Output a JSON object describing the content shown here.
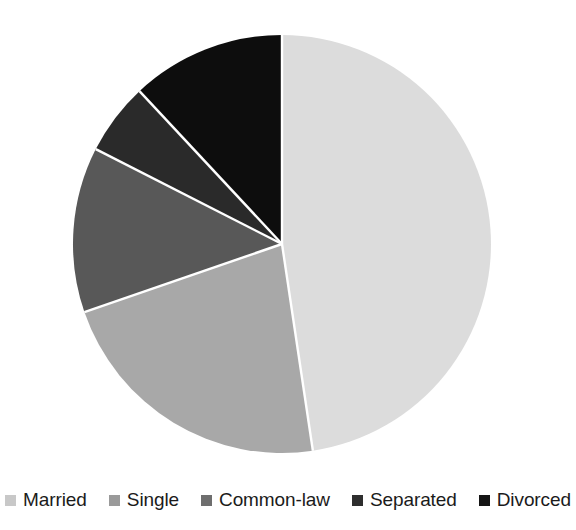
{
  "chart_data": {
    "type": "pie",
    "title": "",
    "subtitle": "",
    "xlabel": "",
    "ylabel": "",
    "legend_position": "bottom",
    "grid": false,
    "start_angle_deg": 0,
    "direction": "clockwise",
    "categories": [
      "Married",
      "Single",
      "Common-law",
      "Separated",
      "Divorced"
    ],
    "values": [
      47.6,
      22.1,
      12.8,
      5.6,
      11.9
    ],
    "units": "percent",
    "slices": [
      {
        "label": "Married",
        "value": 47.6,
        "color": "#dcdcdc",
        "start_deg": 0.0,
        "end_deg": 171.5
      },
      {
        "label": "Single",
        "value": 22.1,
        "color": "#a8a8a8",
        "start_deg": 171.5,
        "end_deg": 251.0
      },
      {
        "label": "Common-law",
        "value": 12.8,
        "color": "#585858",
        "start_deg": 251.0,
        "end_deg": 297.0
      },
      {
        "label": "Separated",
        "value": 5.6,
        "color": "#2a2a2a",
        "start_deg": 297.0,
        "end_deg": 317.0
      },
      {
        "label": "Divorced",
        "value": 11.9,
        "color": "#0d0d0d",
        "start_deg": 317.0,
        "end_deg": 360.0
      }
    ]
  },
  "geometry": {
    "cx": 282,
    "cy": 244,
    "radius": 209,
    "separator_color": "#ffffff",
    "separator_width": 2.4
  },
  "legend": {
    "items": [
      {
        "label": "Married",
        "color": "#c8c8c8"
      },
      {
        "label": "Single",
        "color": "#9a9a9a"
      },
      {
        "label": "Common-law",
        "color": "#6e6e6e"
      },
      {
        "label": "Separated",
        "color": "#2e2e2e"
      },
      {
        "label": "Divorced",
        "color": "#151515"
      }
    ]
  },
  "canvas": {
    "background": "#ffffff",
    "text_color": "#1b1b1b"
  }
}
